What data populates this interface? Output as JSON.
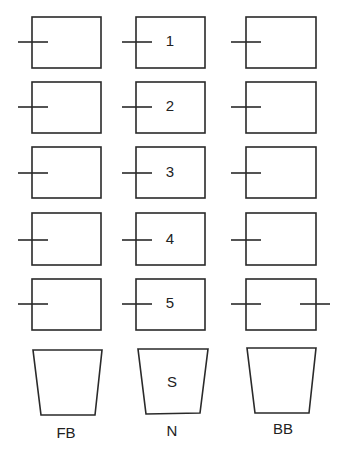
{
  "diagram": {
    "columns": [
      {
        "key": "FB",
        "label": "FB",
        "x": 32,
        "width": 69,
        "tick_x1": 18,
        "tick_x2": 48
      },
      {
        "key": "N",
        "label": "N",
        "x": 136,
        "width": 69,
        "tick_x1": 122,
        "tick_x2": 152
      },
      {
        "key": "BB",
        "label": "BB",
        "x": 246,
        "width": 70,
        "tick_x1": 231,
        "tick_x2": 261
      }
    ],
    "rows": [
      {
        "top": 17,
        "height": 51,
        "tick_y": 42,
        "label": "1"
      },
      {
        "top": 82,
        "height": 51,
        "tick_y": 107,
        "label": "2"
      },
      {
        "top": 147,
        "height": 51,
        "tick_y": 173,
        "label": "3"
      },
      {
        "top": 213,
        "height": 52,
        "tick_y": 240,
        "label": "4"
      },
      {
        "top": 279,
        "height": 51,
        "tick_y": 304,
        "label": "5"
      }
    ],
    "extra_tick": {
      "column": "BB",
      "row": 5,
      "x1": 300,
      "x2": 330,
      "y": 304
    },
    "trapezoids": [
      {
        "key": "FB",
        "points": "33,350 102,350 95,415 41,415",
        "inner_label": "",
        "label": "FB",
        "label_x": 66,
        "label_y": 434
      },
      {
        "key": "N",
        "points": "138,349 208,349 200,413 146,414",
        "inner_label": "S",
        "inner_x": 172,
        "inner_y": 383,
        "label": "N",
        "label_x": 172,
        "label_y": 432
      },
      {
        "key": "BB",
        "points": "247,348 316,348 309,413 255,413",
        "inner_label": "",
        "label": "BB",
        "label_x": 283,
        "label_y": 430
      }
    ],
    "colors": {
      "stroke": "#2a2a2a",
      "text": "#222222",
      "background": "#ffffff"
    }
  }
}
